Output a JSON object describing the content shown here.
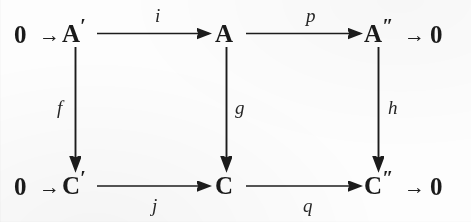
{
  "diagram": {
    "kind": "commutative-diagram",
    "background_color": "#fdfdfd",
    "ink_color": "#1c1c1c",
    "rows": [
      {
        "id": "top-row",
        "zero_left": "0",
        "zero_right": "0",
        "objects": [
          {
            "id": "A-prime",
            "symbol": "A",
            "prime": "′"
          },
          {
            "id": "A",
            "symbol": "A",
            "prime": ""
          },
          {
            "id": "A-double-prime",
            "symbol": "A",
            "prime": "″"
          }
        ],
        "maps": [
          {
            "id": "i",
            "label": "i",
            "from": "A-prime",
            "to": "A"
          },
          {
            "id": "p",
            "label": "p",
            "from": "A",
            "to": "A-double-prime"
          }
        ]
      },
      {
        "id": "bottom-row",
        "zero_left": "0",
        "zero_right": "0",
        "objects": [
          {
            "id": "C-prime",
            "symbol": "C",
            "prime": "′"
          },
          {
            "id": "C",
            "symbol": "C",
            "prime": ""
          },
          {
            "id": "C-double-prime",
            "symbol": "C",
            "prime": "″"
          }
        ],
        "maps": [
          {
            "id": "j",
            "label": "j",
            "from": "C-prime",
            "to": "C"
          },
          {
            "id": "q",
            "label": "q",
            "from": "C",
            "to": "C-double-prime"
          }
        ]
      }
    ],
    "vertical_maps": [
      {
        "id": "f",
        "label": "f",
        "from": "A-prime",
        "to": "C-prime"
      },
      {
        "id": "g",
        "label": "g",
        "from": "A",
        "to": "C"
      },
      {
        "id": "h",
        "label": "h",
        "from": "A-double-prime",
        "to": "C-double-prime"
      }
    ],
    "short_arrow_glyph": "→"
  }
}
